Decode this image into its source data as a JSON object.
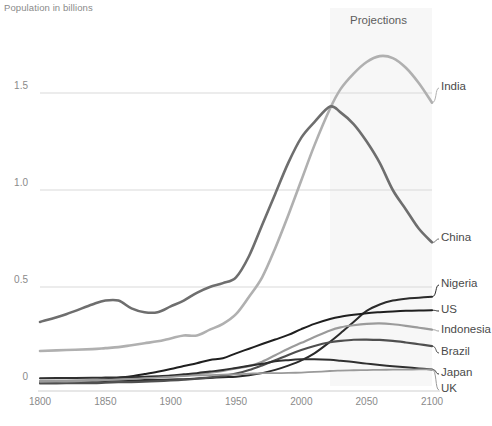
{
  "chart_data": {
    "type": "line",
    "title": "Population in billions",
    "xlabel": "",
    "ylabel": "Population in billions",
    "xlim": [
      1800,
      2100
    ],
    "ylim": [
      0,
      1.85
    ],
    "x_ticks": [
      1800,
      1850,
      1900,
      1950,
      2000,
      2050,
      2100
    ],
    "y_ticks": [
      0,
      0.5,
      1.0,
      1.5
    ],
    "y_tick_labels": [
      "0",
      "0.5",
      "1.0",
      "1.5"
    ],
    "grid": "horizontal",
    "legend_position": "right-inline-labels",
    "annotations": [
      {
        "text": "Projections",
        "x": 2040,
        "note": "shaded band covering 2022-2100"
      }
    ],
    "projection_band": {
      "start": 2022,
      "end": 2100,
      "color": "#f7f7f7"
    },
    "x": [
      1800,
      1820,
      1840,
      1850,
      1860,
      1870,
      1880,
      1890,
      1900,
      1910,
      1920,
      1930,
      1940,
      1950,
      1960,
      1970,
      1980,
      1990,
      2000,
      2010,
      2022,
      2030,
      2040,
      2050,
      2060,
      2070,
      2080,
      2090,
      2100
    ],
    "series": [
      {
        "name": "India",
        "color": "#b0b0b0",
        "width": 2.6,
        "values": [
          0.17,
          0.175,
          0.18,
          0.185,
          0.19,
          0.2,
          0.21,
          0.22,
          0.235,
          0.25,
          0.25,
          0.28,
          0.31,
          0.36,
          0.45,
          0.55,
          0.7,
          0.87,
          1.05,
          1.23,
          1.42,
          1.52,
          1.6,
          1.66,
          1.69,
          1.68,
          1.63,
          1.55,
          1.45
        ]
      },
      {
        "name": "China",
        "color": "#6e6e6e",
        "width": 2.6,
        "values": [
          0.32,
          0.36,
          0.41,
          0.43,
          0.43,
          0.39,
          0.37,
          0.37,
          0.4,
          0.43,
          0.47,
          0.5,
          0.52,
          0.55,
          0.66,
          0.82,
          0.98,
          1.14,
          1.27,
          1.35,
          1.43,
          1.4,
          1.34,
          1.25,
          1.14,
          1.0,
          0.9,
          0.8,
          0.73
        ]
      },
      {
        "name": "Nigeria",
        "color": "#2b2b2b",
        "width": 2.0,
        "values": [
          0.013,
          0.014,
          0.015,
          0.016,
          0.017,
          0.018,
          0.02,
          0.021,
          0.023,
          0.025,
          0.028,
          0.031,
          0.035,
          0.038,
          0.045,
          0.056,
          0.073,
          0.095,
          0.122,
          0.158,
          0.218,
          0.262,
          0.32,
          0.377,
          0.41,
          0.43,
          0.44,
          0.445,
          0.45
        ]
      },
      {
        "name": "US",
        "color": "#1f1f1f",
        "width": 2.0,
        "values": [
          0.007,
          0.012,
          0.018,
          0.024,
          0.032,
          0.04,
          0.051,
          0.063,
          0.077,
          0.093,
          0.107,
          0.124,
          0.133,
          0.158,
          0.182,
          0.206,
          0.229,
          0.253,
          0.283,
          0.31,
          0.335,
          0.347,
          0.357,
          0.365,
          0.37,
          0.374,
          0.377,
          0.379,
          0.38
        ]
      },
      {
        "name": "Indonesia",
        "color": "#9b9b9b",
        "width": 2.2,
        "values": [
          0.016,
          0.018,
          0.02,
          0.022,
          0.025,
          0.028,
          0.031,
          0.035,
          0.039,
          0.044,
          0.05,
          0.058,
          0.068,
          0.08,
          0.092,
          0.115,
          0.148,
          0.182,
          0.212,
          0.242,
          0.276,
          0.292,
          0.303,
          0.31,
          0.312,
          0.308,
          0.3,
          0.29,
          0.28
        ]
      },
      {
        "name": "Brazil",
        "color": "#4f4f4f",
        "width": 2.2,
        "values": [
          0.003,
          0.004,
          0.005,
          0.007,
          0.009,
          0.01,
          0.012,
          0.015,
          0.018,
          0.022,
          0.027,
          0.034,
          0.042,
          0.054,
          0.072,
          0.096,
          0.122,
          0.15,
          0.175,
          0.196,
          0.215,
          0.222,
          0.228,
          0.229,
          0.227,
          0.222,
          0.214,
          0.205,
          0.195
        ]
      },
      {
        "name": "Japan",
        "color": "#2f2f2f",
        "width": 2.0,
        "values": [
          0.03,
          0.031,
          0.032,
          0.033,
          0.034,
          0.035,
          0.037,
          0.04,
          0.044,
          0.05,
          0.056,
          0.064,
          0.072,
          0.083,
          0.094,
          0.104,
          0.117,
          0.123,
          0.127,
          0.128,
          0.125,
          0.12,
          0.113,
          0.105,
          0.098,
          0.092,
          0.086,
          0.08,
          0.075
        ]
      },
      {
        "name": "UK",
        "color": "#9a9a9a",
        "width": 1.8,
        "values": [
          0.011,
          0.013,
          0.017,
          0.02,
          0.023,
          0.026,
          0.03,
          0.033,
          0.037,
          0.041,
          0.044,
          0.046,
          0.048,
          0.05,
          0.053,
          0.056,
          0.056,
          0.057,
          0.059,
          0.062,
          0.067,
          0.069,
          0.071,
          0.072,
          0.073,
          0.074,
          0.074,
          0.075,
          0.075
        ]
      }
    ],
    "series_labels": [
      {
        "name": "India",
        "label_y": 88
      },
      {
        "name": "China",
        "label_y": 239
      },
      {
        "name": "Nigeria",
        "label_y": 285
      },
      {
        "name": "US",
        "label_y": 311
      },
      {
        "name": "Indonesia",
        "label_y": 331
      },
      {
        "name": "Brazil",
        "label_y": 353
      },
      {
        "name": "Japan",
        "label_y": 374
      },
      {
        "name": "UK",
        "label_y": 390
      }
    ]
  },
  "footnote": {
    "text": ""
  }
}
